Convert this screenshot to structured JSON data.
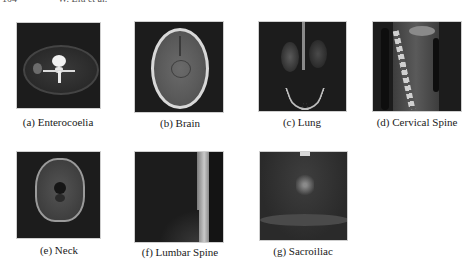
{
  "header": {
    "page_number": "104",
    "running_head": "W. Liu et al."
  },
  "figure": {
    "panels": [
      {
        "id": "a",
        "caption": "(a) Enterocoelia",
        "subject": "abdominal CT axial slice"
      },
      {
        "id": "b",
        "caption": "(b) Brain",
        "subject": "axial brain MRI"
      },
      {
        "id": "c",
        "caption": "(c) Lung",
        "subject": "coronal lung MRI"
      },
      {
        "id": "d",
        "caption": "(d) Cervical Spine",
        "subject": "sagittal cervical spine MRI"
      },
      {
        "id": "e",
        "caption": "(e) Neck",
        "subject": "axial neck MRI"
      },
      {
        "id": "f",
        "caption": "(f) Lumbar Spine",
        "subject": "sagittal lumbar spine MRI"
      },
      {
        "id": "g",
        "caption": "(g) Sacroiliac",
        "subject": "coronal sacroiliac MRI"
      }
    ]
  }
}
